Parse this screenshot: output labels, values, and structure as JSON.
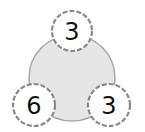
{
  "diagram": {
    "type": "number-bond",
    "whole": {
      "value": "",
      "fill": "#e6e6e6",
      "stroke": "#9a9a9a"
    },
    "parts": [
      {
        "id": "top",
        "value": "3"
      },
      {
        "id": "bottom-left",
        "value": "6"
      },
      {
        "id": "bottom-right",
        "value": "3"
      }
    ],
    "part_style": {
      "fill": "#ffffff",
      "stroke": "#8a8a8a",
      "dashed": true
    }
  }
}
